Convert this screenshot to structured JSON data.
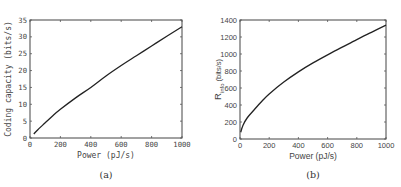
{
  "chart_data": [
    {
      "type": "line",
      "panel_label": "(a)",
      "title": "",
      "xlabel": "Power (pJ/s)",
      "ylabel": "Coding capacity (bits/s)",
      "xlim": [
        0,
        1000
      ],
      "ylim": [
        0,
        35
      ],
      "xticks": [
        0,
        200,
        400,
        600,
        800,
        1000
      ],
      "yticks": [
        0,
        5,
        10,
        15,
        20,
        25,
        30,
        35
      ],
      "grid": false,
      "legend": null,
      "series": [
        {
          "name": "Coding capacity",
          "color": "#222222",
          "x": [
            25,
            50,
            100,
            150,
            200,
            300,
            400,
            500,
            600,
            700,
            800,
            900,
            1000
          ],
          "y": [
            1.2,
            2.4,
            4.5,
            6.6,
            8.5,
            11.9,
            15.0,
            18.4,
            21.5,
            24.4,
            27.3,
            30.2,
            33.0
          ]
        }
      ]
    },
    {
      "type": "line",
      "panel_label": "(b)",
      "title": "",
      "xlabel": "Power (pJ/s)",
      "ylabel": "R_info (bits/s)",
      "ylabel_main": "R",
      "ylabel_sub": "info",
      "ylabel_unit": "(bits/s)",
      "xlim": [
        0,
        1000
      ],
      "ylim": [
        0,
        1400
      ],
      "xticks": [
        0,
        200,
        400,
        600,
        800,
        1000
      ],
      "yticks": [
        0,
        200,
        400,
        600,
        800,
        1000,
        1200,
        1400
      ],
      "grid": false,
      "legend": null,
      "series": [
        {
          "name": "R_info",
          "color": "#222222",
          "x": [
            5,
            20,
            50,
            100,
            150,
            200,
            300,
            400,
            500,
            600,
            700,
            800,
            900,
            1000
          ],
          "y": [
            80,
            160,
            250,
            350,
            445,
            530,
            670,
            790,
            895,
            990,
            1080,
            1170,
            1255,
            1340
          ]
        }
      ]
    }
  ]
}
